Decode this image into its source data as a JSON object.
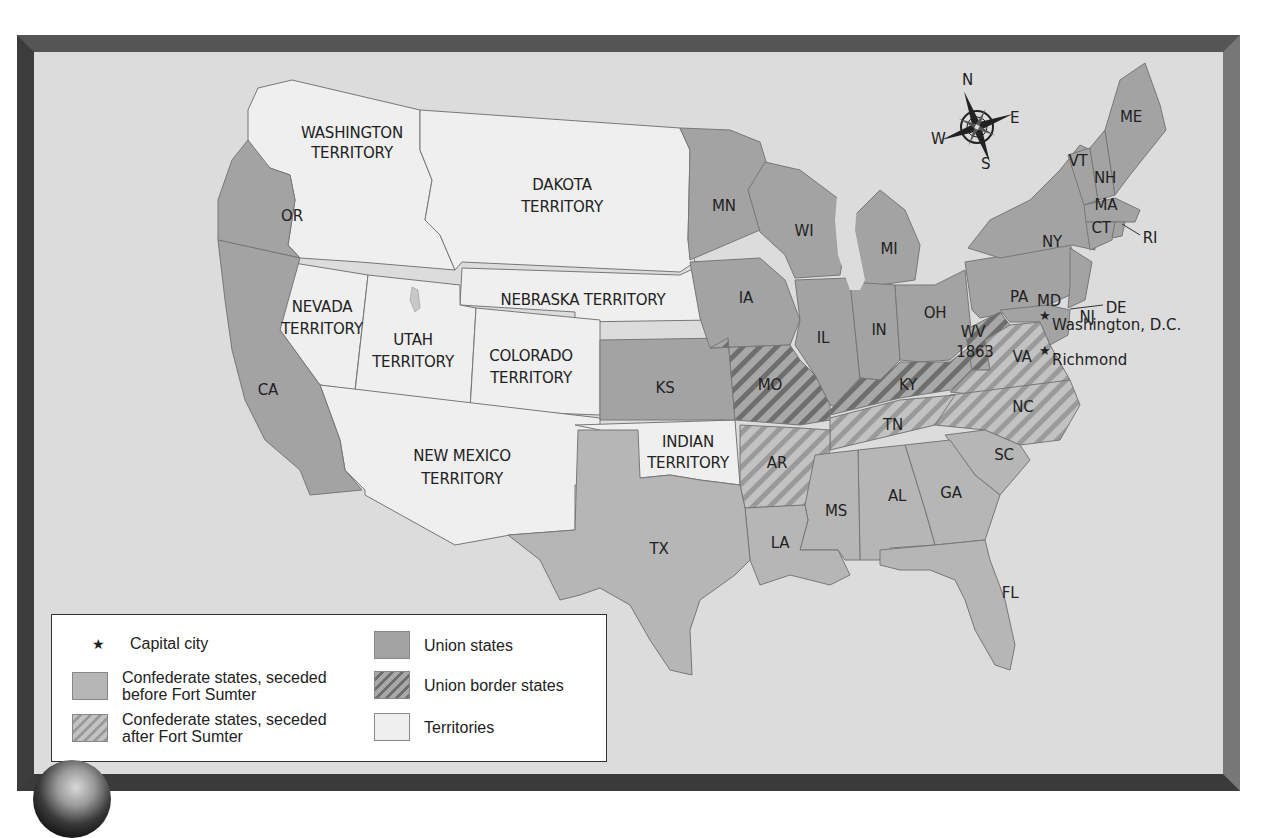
{
  "map": {
    "colors": {
      "sea": "#dcdcdc",
      "union": "#a3a3a3",
      "confederate_before": "#b6b6b6",
      "confederate_after_bg": "#c2c2c2",
      "confederate_after_stripe": "#9a9a9a",
      "border_bg": "#a8a8a8",
      "border_stripe": "#6e6e6e",
      "territory": "#efefef",
      "frame": "#4a4a4a"
    },
    "compass": {
      "n": "N",
      "e": "E",
      "s": "S",
      "w": "W"
    },
    "territories": {
      "washington": [
        "WASHINGTON",
        "TERRITORY"
      ],
      "dakota": [
        "DAKOTA",
        "TERRITORY"
      ],
      "nebraska": "NEBRASKA TERRITORY",
      "nevada": [
        "NEVADA",
        "TERRITORY"
      ],
      "utah": [
        "UTAH",
        "TERRITORY"
      ],
      "colorado": [
        "COLORADO",
        "TERRITORY"
      ],
      "new_mexico": [
        "NEW MEXICO",
        "TERRITORY"
      ],
      "indian": [
        "INDIAN",
        "TERRITORY"
      ]
    },
    "states": {
      "OR": "OR",
      "CA": "CA",
      "KS": "KS",
      "MN": "MN",
      "WI": "WI",
      "MI": "MI",
      "IA": "IA",
      "IL": "IL",
      "IN": "IN",
      "OH": "OH",
      "PA": "PA",
      "NY": "NY",
      "NJ": "NJ",
      "ME": "ME",
      "VT": "VT",
      "NH": "NH",
      "MA": "MA",
      "CT": "CT",
      "RI": "RI",
      "DE": "DE",
      "MD": "MD",
      "MO": "MO",
      "KY": "KY",
      "WV": [
        "WV",
        "1863"
      ],
      "VA": "VA",
      "NC": "NC",
      "TN": "TN",
      "AR": "AR",
      "SC": "SC",
      "GA": "GA",
      "AL": "AL",
      "MS": "MS",
      "LA": "LA",
      "TX": "TX",
      "FL": "FL"
    },
    "cities": {
      "washington_dc": "Washington, D.C.",
      "richmond": "Richmond"
    }
  },
  "legend": {
    "capital": {
      "symbol": "★",
      "label": "Capital city"
    },
    "confederate_before": [
      "Confederate states, seceded",
      "before Fort Sumter"
    ],
    "confederate_after": [
      "Confederate states, seceded",
      "after Fort Sumter"
    ],
    "union": "Union states",
    "border": "Union border states",
    "territories": "Territories"
  }
}
